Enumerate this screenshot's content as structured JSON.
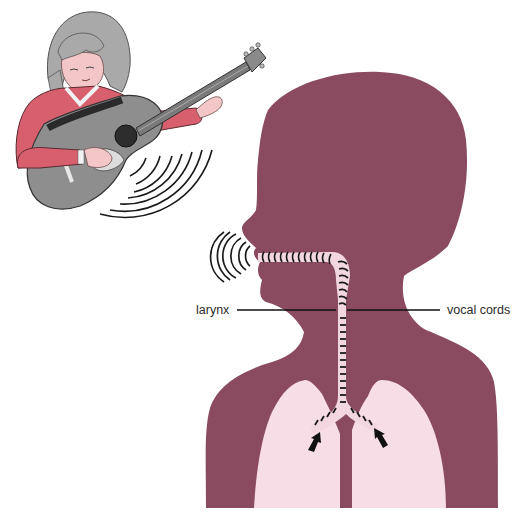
{
  "figure": {
    "colors": {
      "body_silhouette": "#8a4a60",
      "lungs": "#f6dde6",
      "airway": "#f3d7e0",
      "airway_marks": "#1a1a1a",
      "sound_waves": "#1a1a1a",
      "shirt": "#d9606e",
      "hair": "#a8a8a8",
      "skin": "#f4c7c9",
      "guitar_body": "#8d8d8d",
      "guitar_hole": "#2a2a2a"
    },
    "labels": {
      "larynx": "larynx",
      "vocal_cords": "vocal cords"
    },
    "elements": {
      "guitarist": "child playing acoustic guitar",
      "guitar_sound_waves": "sound waves from guitar",
      "head_silhouette": "human head and torso in profile",
      "mouth_sound_waves": "sound waves from mouth",
      "airway": "trachea with vibration marks",
      "lungs": "left and right lungs",
      "airflow_arrows": "arrows showing air rising from lungs"
    }
  }
}
